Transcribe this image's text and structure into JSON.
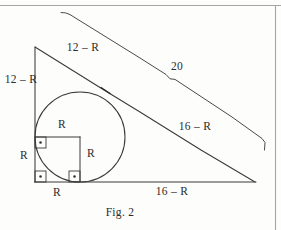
{
  "page": {
    "background_color": "#fdfdfc",
    "ink_color": "#2b2b2b",
    "rule_color": "#9a9a9a"
  },
  "figure": {
    "caption": "Fig. 2",
    "labels": {
      "hypotenuse_upper": "12 – R",
      "leg_vertical": "12 – R",
      "outer_hypotenuse": "20",
      "hypotenuse_lower": "16 – R",
      "base_right": "16 – R",
      "radius_top": "R",
      "radius_right": "R",
      "radius_left": "R",
      "radius_bottom": "R"
    },
    "geometry": {
      "apex": [
        35,
        47
      ],
      "bottom_left": [
        35,
        182
      ],
      "bottom_right": [
        255,
        182
      ],
      "circle_center": [
        80,
        137
      ],
      "circle_radius": 45,
      "square_top_left": [
        35,
        137
      ],
      "square_bottom_right": [
        80,
        182
      ],
      "tangent_point_hypotenuse": [
        106,
        91
      ]
    }
  },
  "rules": {
    "top_rule_y": 5,
    "right_rule_x": 275
  }
}
